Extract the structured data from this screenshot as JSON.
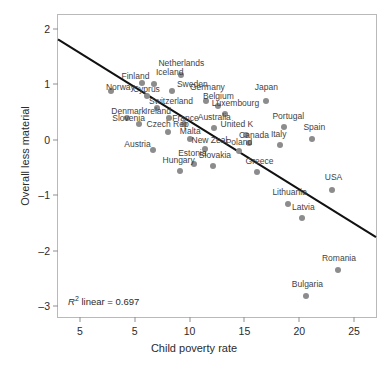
{
  "chart_data": {
    "type": "scatter",
    "title": "",
    "xlabel": "Child poverty rate",
    "ylabel": "Overall less material",
    "xlim": [
      3.4,
      26.6
    ],
    "ylim": [
      -3.2,
      2.25
    ],
    "xticks": [
      5,
      5,
      10,
      15,
      20,
      25
    ],
    "xtick_labels": [
      "5",
      "5",
      "10",
      "15",
      "20",
      "25"
    ],
    "yticks": [
      2,
      1,
      0,
      -1,
      -2,
      -3
    ],
    "ytick_labels": [
      "2",
      "1",
      "0",
      "–1",
      "–2",
      "–3"
    ],
    "grid": false,
    "legend": null,
    "point_color": "#8c8c8c",
    "line_color": "#111111",
    "frame_color": "#b9b9b9",
    "annotation": {
      "prefix": "R",
      "superscript": "2",
      "text": " linear = 0.697",
      "full": "R² linear = 0.697"
    },
    "trendline": {
      "type": "linear",
      "r_squared": 0.697,
      "x_start": 3.4,
      "y_start": 1.81,
      "x_end": 26.6,
      "y_end": -1.76
    },
    "points": [
      {
        "label": "Netherlands",
        "x": 12.4,
        "y": 1.17,
        "lx": 12.4,
        "ly": 1.3
      },
      {
        "label": "Iceland",
        "x": 10.4,
        "y": 1.0,
        "lx": 11.55,
        "ly": 1.13
      },
      {
        "label": "Finland",
        "x": 9.55,
        "y": 1.02,
        "lx": 9.05,
        "ly": 1.06
      },
      {
        "label": "Norway",
        "x": 7.25,
        "y": 0.88,
        "lx": 7.95,
        "ly": 0.86
      },
      {
        "label": "Sweden",
        "x": 11.7,
        "y": 0.88,
        "lx": 13.2,
        "ly": 0.92
      },
      {
        "label": "Cyprus",
        "x": 9.9,
        "y": 0.78,
        "lx": 9.85,
        "ly": 0.83
      },
      {
        "label": "Germany",
        "x": 14.2,
        "y": 0.7,
        "lx": 14.3,
        "ly": 0.86
      },
      {
        "label": "Belgium",
        "x": 15.1,
        "y": 0.6,
        "lx": 15.1,
        "ly": 0.7
      },
      {
        "label": "Japan",
        "x": 18.6,
        "y": 0.7,
        "lx": 18.6,
        "ly": 0.86
      },
      {
        "label": "Switzerland",
        "x": 10.6,
        "y": 0.58,
        "lx": 11.65,
        "ly": 0.6
      },
      {
        "label": "Luxembourg",
        "x": 15.6,
        "y": 0.46,
        "lx": 16.35,
        "ly": 0.58
      },
      {
        "label": "Ireland",
        "x": 11.5,
        "y": 0.4,
        "lx": 10.7,
        "ly": 0.43
      },
      {
        "label": "Denmark",
        "x": 8.4,
        "y": 0.4,
        "lx": 8.55,
        "ly": 0.43
      },
      {
        "label": "Slovenia",
        "x": 9.3,
        "y": 0.28,
        "lx": 8.55,
        "ly": 0.31
      },
      {
        "label": "France",
        "x": 12.6,
        "y": 0.28,
        "lx": 12.7,
        "ly": 0.31
      },
      {
        "label": "Australia",
        "x": 14.8,
        "y": 0.21,
        "lx": 14.8,
        "ly": 0.32
      },
      {
        "label": "Portugal",
        "x": 19.9,
        "y": 0.22,
        "lx": 20.2,
        "ly": 0.34
      },
      {
        "label": "Czech Rep",
        "x": 11.4,
        "y": 0.13,
        "lx": 11.4,
        "ly": 0.2
      },
      {
        "label": "United K",
        "x": 17.1,
        "y": 0.08,
        "lx": 16.45,
        "ly": 0.2
      },
      {
        "label": "Spain",
        "x": 21.9,
        "y": 0.02,
        "lx": 22.1,
        "ly": 0.14
      },
      {
        "label": "Malta",
        "x": 13.0,
        "y": 0.02,
        "lx": 13.05,
        "ly": 0.07
      },
      {
        "label": "Canada",
        "x": 17.3,
        "y": -0.06,
        "lx": 17.7,
        "ly": -0.01
      },
      {
        "label": "Italy",
        "x": 19.6,
        "y": -0.1,
        "lx": 19.5,
        "ly": 0.02
      },
      {
        "label": "Austria",
        "x": 10.3,
        "y": -0.18,
        "lx": 9.2,
        "ly": -0.16
      },
      {
        "label": "New Zeal",
        "x": 14.1,
        "y": -0.16,
        "lx": 14.45,
        "ly": -0.1
      },
      {
        "label": "Poland",
        "x": 16.6,
        "y": -0.21,
        "lx": 16.6,
        "ly": -0.13
      },
      {
        "label": "Estonia",
        "x": 13.3,
        "y": -0.44,
        "lx": 13.2,
        "ly": -0.33
      },
      {
        "label": "Slovakia",
        "x": 14.7,
        "y": -0.48,
        "lx": 14.85,
        "ly": -0.36
      },
      {
        "label": "Hungary",
        "x": 12.3,
        "y": -0.56,
        "lx": 12.2,
        "ly": -0.45
      },
      {
        "label": "Greece",
        "x": 17.9,
        "y": -0.58,
        "lx": 18.1,
        "ly": -0.47
      },
      {
        "label": "Lithuania",
        "x": 20.2,
        "y": -1.16,
        "lx": 20.3,
        "ly": -1.04
      },
      {
        "label": "USA",
        "x": 23.4,
        "y": -0.9,
        "lx": 23.5,
        "ly": -0.76
      },
      {
        "label": "Latvia",
        "x": 21.2,
        "y": -1.42,
        "lx": 21.3,
        "ly": -1.3
      },
      {
        "label": "Romania",
        "x": 23.8,
        "y": -2.35,
        "lx": 23.9,
        "ly": -2.22
      },
      {
        "label": "Bulgaria",
        "x": 21.5,
        "y": -2.83,
        "lx": 21.6,
        "ly": -2.7
      }
    ]
  }
}
